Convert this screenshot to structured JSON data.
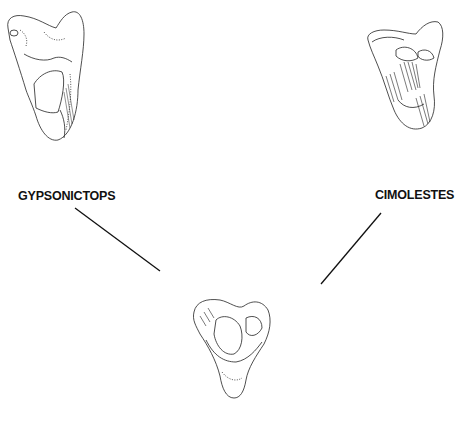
{
  "figure": {
    "taxa": [
      {
        "id": "gypsonictops",
        "label": "GYPSONICTOPS",
        "position": "upper-left"
      },
      {
        "id": "cimolestes",
        "label": "CIMOLESTES",
        "position": "upper-right"
      },
      {
        "id": "ancestor",
        "label": "",
        "position": "bottom-center"
      }
    ],
    "connectors": [
      {
        "from": "gypsonictops",
        "to": "ancestor"
      },
      {
        "from": "cimolestes",
        "to": "ancestor"
      }
    ],
    "colors": {
      "ink": "#111111",
      "background": "#ffffff"
    }
  }
}
